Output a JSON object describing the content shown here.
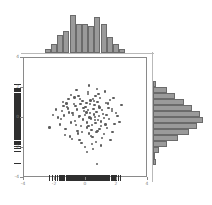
{
  "chart_data": {
    "type": "scatter",
    "title": "",
    "subtitle": "",
    "xlabel": "",
    "ylabel": "",
    "xlim": [
      -4,
      4
    ],
    "ylim": [
      -4,
      4
    ],
    "grid": false,
    "legend": null,
    "xticks": [
      -4,
      -2,
      0,
      2,
      4
    ],
    "xticklabels": [
      "-4",
      "-2",
      "0",
      "2",
      "4"
    ],
    "yticks": [
      -4,
      -2,
      0,
      2,
      4
    ],
    "yticklabels": [
      "-4",
      "-2",
      "0",
      "2",
      "4"
    ],
    "marker": {
      "shape": "circle",
      "color": "#5e5e5e",
      "size": 2.4
    },
    "n_points": 120,
    "points": [
      [
        0.62,
        1.45
      ],
      [
        -0.35,
        0.92
      ],
      [
        1.1,
        0.28
      ],
      [
        -1.42,
        0.18
      ],
      [
        0.05,
        -0.64
      ],
      [
        0.88,
        0.71
      ],
      [
        -0.22,
        1.12
      ],
      [
        1.66,
        0.45
      ],
      [
        -0.95,
        -0.31
      ],
      [
        0.33,
        -1.18
      ],
      [
        -0.58,
        0.56
      ],
      [
        2.02,
        0.12
      ],
      [
        0.14,
        1.72
      ],
      [
        -1.8,
        0.04
      ],
      [
        0.74,
        -0.86
      ],
      [
        -0.41,
        -1.45
      ],
      [
        1.28,
        1.02
      ],
      [
        0.02,
        0.37
      ],
      [
        -0.67,
        0.81
      ],
      [
        0.96,
        -0.24
      ],
      [
        -1.15,
        0.64
      ],
      [
        0.47,
        1.28
      ],
      [
        1.84,
        -0.38
      ],
      [
        -0.08,
        -1.92
      ],
      [
        0.59,
        0.08
      ],
      [
        -1.33,
        -0.72
      ],
      [
        0.25,
        0.95
      ],
      [
        1.02,
        -1.34
      ],
      [
        -0.74,
        1.38
      ],
      [
        0.38,
        -0.45
      ],
      [
        -2.12,
        0.22
      ],
      [
        0.81,
        1.61
      ],
      [
        -0.18,
        -0.09
      ],
      [
        1.45,
        0.68
      ],
      [
        -0.52,
        -1.02
      ],
      [
        0.12,
        0.52
      ],
      [
        2.28,
        0.88
      ],
      [
        -0.88,
        0.32
      ],
      [
        0.66,
        -1.58
      ],
      [
        -1.55,
        0.48
      ],
      [
        0.29,
        1.18
      ],
      [
        1.18,
        0.01
      ],
      [
        -0.31,
        -0.55
      ],
      [
        0.92,
        1.34
      ],
      [
        -1.02,
        -1.22
      ],
      [
        0.51,
        0.24
      ],
      [
        -0.62,
        1.85
      ],
      [
        1.72,
        -0.92
      ],
      [
        0.08,
        -0.31
      ],
      [
        -1.25,
        0.98
      ],
      [
        0.44,
        -2.05
      ],
      [
        1.55,
        1.22
      ],
      [
        -0.04,
        0.74
      ],
      [
        0.78,
        -0.12
      ],
      [
        -0.45,
        0.06
      ],
      [
        1.35,
        -0.68
      ],
      [
        -1.68,
        -0.42
      ],
      [
        0.21,
        2.18
      ],
      [
        0.68,
        0.41
      ],
      [
        -0.98,
        1.55
      ],
      [
        0.35,
        -0.78
      ],
      [
        1.92,
        0.34
      ],
      [
        -0.28,
        -1.65
      ],
      [
        0.55,
        0.88
      ],
      [
        -1.48,
        1.08
      ],
      [
        0.98,
        -0.52
      ],
      [
        0.02,
        1.02
      ],
      [
        -0.72,
        -0.18
      ],
      [
        1.22,
        1.78
      ],
      [
        0.41,
        -1.28
      ],
      [
        -2.35,
        -0.62
      ],
      [
        0.85,
        0.14
      ],
      [
        -0.15,
        0.65
      ],
      [
        1.58,
        -1.45
      ],
      [
        -1.08,
        0.38
      ],
      [
        0.32,
        -0.02
      ],
      [
        0.71,
        1.92
      ],
      [
        -0.55,
        -0.88
      ],
      [
        1.05,
        0.55
      ],
      [
        -0.38,
        1.25
      ],
      [
        0.18,
        -1.02
      ],
      [
        2.15,
        -0.25
      ],
      [
        -1.22,
        0.72
      ],
      [
        0.62,
        -0.35
      ],
      [
        -0.82,
        0.22
      ],
      [
        1.42,
        0.98
      ],
      [
        0.05,
        -2.28
      ],
      [
        -0.48,
        1.48
      ],
      [
        0.88,
        -0.72
      ],
      [
        -1.62,
        -0.08
      ],
      [
        0.26,
        0.32
      ],
      [
        1.15,
        -1.05
      ],
      [
        -0.12,
        0.48
      ],
      [
        0.75,
        1.08
      ],
      [
        -1.35,
        -1.12
      ],
      [
        0.48,
        0.62
      ],
      [
        1.78,
        1.35
      ],
      [
        -0.65,
        -0.48
      ],
      [
        0.11,
        1.62
      ],
      [
        -0.92,
        -1.38
      ],
      [
        0.58,
        -0.15
      ],
      [
        1.32,
        0.22
      ],
      [
        -0.25,
        -0.95
      ],
      [
        0.82,
        0.78
      ],
      [
        -1.95,
        0.58
      ],
      [
        0.38,
        -1.72
      ],
      [
        1.48,
        -0.05
      ],
      [
        -0.42,
        0.14
      ],
      [
        0.68,
        -0.95
      ],
      [
        -1.12,
        1.28
      ],
      [
        0.22,
        0.04
      ],
      [
        0.95,
        -1.82
      ],
      [
        -0.78,
        0.92
      ],
      [
        1.25,
        -0.42
      ],
      [
        -0.05,
        0.21
      ],
      [
        0.52,
        1.15
      ],
      [
        -1.45,
        0.81
      ],
      [
        1.68,
        0.62
      ],
      [
        0.15,
        -0.52
      ],
      [
        0.72,
        -3.05
      ]
    ],
    "top_histogram": {
      "type": "bar",
      "orientation": "vertical",
      "axis": "x",
      "bin_edges": [
        -2.6,
        -2.2,
        -1.8,
        -1.4,
        -1.0,
        -0.6,
        -0.2,
        0.2,
        0.6,
        1.0,
        1.4,
        1.8,
        2.2,
        2.6
      ],
      "counts": [
        2,
        4,
        8,
        10,
        17,
        13,
        13,
        12,
        16,
        13,
        7,
        4,
        2
      ],
      "bar_color": "#9a9a9a",
      "edge_color": "#6b6b6b"
    },
    "right_histogram": {
      "type": "bar",
      "orientation": "horizontal",
      "axis": "y",
      "bin_edges": [
        -3.2,
        -2.8,
        -2.4,
        -2.0,
        -1.6,
        -1.2,
        -0.8,
        -0.4,
        0.0,
        0.4,
        0.8,
        1.2,
        1.6,
        2.0,
        2.4
      ],
      "counts": [
        1,
        0,
        2,
        5,
        9,
        13,
        16,
        18,
        17,
        14,
        11,
        8,
        5,
        1
      ],
      "bar_color": "#9a9a9a",
      "edge_color": "#6b6b6b"
    },
    "rug_x": {
      "values": [
        -2.35,
        -2.12,
        -1.95,
        -1.8,
        -1.68,
        -1.62,
        -1.55,
        -1.48,
        -1.45,
        -1.42,
        -1.35,
        -1.33,
        -1.25,
        -1.22,
        -1.15,
        -1.12,
        -1.08,
        -1.02,
        -0.98,
        -0.95,
        -0.92,
        -0.88,
        -0.82,
        -0.78,
        -0.74,
        -0.72,
        -0.67,
        -0.65,
        -0.62,
        -0.58,
        -0.55,
        -0.52,
        -0.48,
        -0.45,
        -0.42,
        -0.41,
        -0.38,
        -0.35,
        -0.31,
        -0.28,
        -0.25,
        -0.22,
        -0.18,
        -0.15,
        -0.12,
        -0.08,
        -0.05,
        -0.04,
        0.02,
        0.02,
        0.05,
        0.05,
        0.08,
        0.11,
        0.12,
        0.14,
        0.15,
        0.18,
        0.21,
        0.22,
        0.25,
        0.26,
        0.29,
        0.32,
        0.33,
        0.35,
        0.38,
        0.38,
        0.41,
        0.44,
        0.47,
        0.48,
        0.51,
        0.52,
        0.55,
        0.58,
        0.59,
        0.62,
        0.62,
        0.66,
        0.68,
        0.68,
        0.71,
        0.72,
        0.74,
        0.75,
        0.78,
        0.81,
        0.82,
        0.85,
        0.88,
        0.88,
        0.92,
        0.95,
        0.96,
        0.98,
        1.02,
        1.05,
        1.1,
        1.15,
        1.18,
        1.22,
        1.25,
        1.28,
        1.32,
        1.35,
        1.42,
        1.45,
        1.48,
        1.55,
        1.58,
        1.66,
        1.68,
        1.72,
        1.78,
        1.84,
        1.92,
        2.02,
        2.15,
        2.28
      ],
      "color": "#2f2f2f"
    },
    "rug_y": {
      "values": [
        -3.05,
        -2.28,
        -2.05,
        -1.92,
        -1.82,
        -1.72,
        -1.65,
        -1.58,
        -1.45,
        -1.45,
        -1.38,
        -1.34,
        -1.28,
        -1.22,
        -1.18,
        -1.12,
        -1.05,
        -1.02,
        -1.02,
        -0.95,
        -0.95,
        -0.92,
        -0.88,
        -0.86,
        -0.78,
        -0.72,
        -0.72,
        -0.68,
        -0.64,
        -0.62,
        -0.55,
        -0.52,
        -0.52,
        -0.48,
        -0.45,
        -0.42,
        -0.38,
        -0.35,
        -0.31,
        -0.31,
        -0.25,
        -0.24,
        -0.18,
        -0.15,
        -0.12,
        -0.09,
        -0.08,
        -0.05,
        -0.02,
        0.01,
        0.04,
        0.04,
        0.06,
        0.08,
        0.12,
        0.14,
        0.14,
        0.18,
        0.21,
        0.22,
        0.22,
        0.24,
        0.28,
        0.32,
        0.32,
        0.34,
        0.37,
        0.38,
        0.41,
        0.45,
        0.48,
        0.48,
        0.52,
        0.55,
        0.56,
        0.58,
        0.62,
        0.62,
        0.64,
        0.65,
        0.68,
        0.71,
        0.72,
        0.74,
        0.78,
        0.81,
        0.81,
        0.88,
        0.88,
        0.92,
        0.92,
        0.95,
        0.98,
        0.98,
        1.02,
        1.02,
        1.08,
        1.08,
        1.12,
        1.15,
        1.18,
        1.22,
        1.25,
        1.28,
        1.28,
        1.34,
        1.35,
        1.38,
        1.45,
        1.48,
        1.55,
        1.61,
        1.62,
        1.72,
        1.78,
        1.85,
        1.92,
        2.18
      ],
      "color": "#2f2f2f"
    }
  }
}
